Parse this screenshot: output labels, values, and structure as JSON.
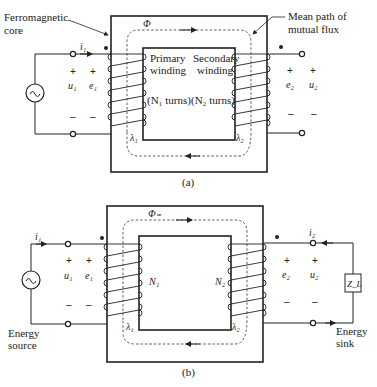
{
  "figure_a": {
    "caption": "(a)",
    "labels": {
      "core": [
        "Ferromagnetic",
        "core"
      ],
      "mean_path": [
        "Mean path of",
        "mutual flux"
      ],
      "flux": "Φ",
      "primary_winding": [
        "Primary",
        "winding"
      ],
      "secondary_winding": [
        "Secondary",
        "winding"
      ],
      "n1_turns": "(N₁ turns)",
      "n2_turns": "(N₂ turns)",
      "i1": "i₁",
      "u1": "u₁",
      "e1": "e₁",
      "e2": "e₂",
      "u2": "u₂",
      "lambda1": "λ₁",
      "lambda2": "λ₂",
      "plus": "+",
      "minus": "–"
    }
  },
  "figure_b": {
    "caption": "(b)",
    "labels": {
      "flux": "Φ₌",
      "n1": "N₁",
      "n2": "N₂",
      "i1": "i₁",
      "i2": "i₂",
      "u1": "u₁",
      "e1": "e₁",
      "e2": "e₂",
      "u2": "u₂",
      "lambda1": "λ₁",
      "lambda2": "λ₂",
      "load": "Z_L",
      "energy_source": [
        "Energy",
        "source"
      ],
      "energy_sink": [
        "Energy",
        "sink"
      ],
      "plus": "+",
      "minus": "–"
    }
  },
  "colors": {
    "line": "#222222",
    "background": "#ffffff"
  }
}
